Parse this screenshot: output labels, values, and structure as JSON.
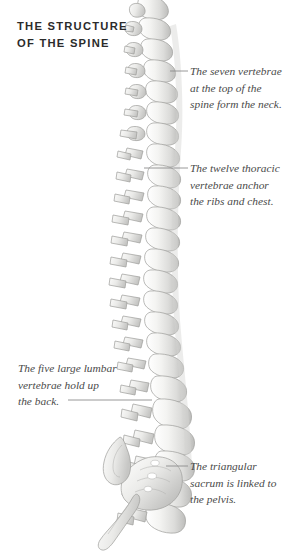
{
  "figure": {
    "title": "THE STRUCTURE\nOF THE SPINE",
    "background_color": "#ffffff",
    "title_color": "#2b2b2b",
    "annotation_color": "#4a4a4a",
    "leader_line_color": "#8c8c8c",
    "bone_fill": "#f2f2f0",
    "bone_outline": "#9a9a98",
    "bone_shadow": "#c8c8c6"
  },
  "annotations": [
    {
      "id": "cervical",
      "text": "The seven vertebrae\nat the top of the\nspine form the neck.",
      "side": "right"
    },
    {
      "id": "thoracic",
      "text": "The twelve thoracic\nvertebrae anchor\nthe ribs and chest.",
      "side": "right"
    },
    {
      "id": "lumbar",
      "text": "The five large lumbar\nvertebrae hold up\nthe back.",
      "side": "left"
    },
    {
      "id": "sacrum",
      "text": "The triangular\nsacrum is linked to\nthe pelvis.",
      "side": "right"
    }
  ],
  "illustration": {
    "subject": "human vertebral column, lateral view",
    "regions": [
      "cervical",
      "thoracic",
      "lumbar",
      "sacrum",
      "coccyx"
    ]
  }
}
